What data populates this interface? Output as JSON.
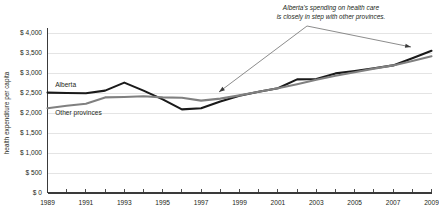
{
  "chart_data": {
    "type": "line",
    "title": "",
    "subtitle": "",
    "xlabel": "",
    "ylabel": "health expenditure per capita",
    "ylim": [
      0,
      4000
    ],
    "xlim": [
      1989,
      2009
    ],
    "grid": true,
    "legend_position": "inline-labels",
    "y_ticks": [
      0,
      500,
      1000,
      1500,
      2000,
      2500,
      3000,
      3500,
      4000
    ],
    "y_tick_labels": [
      "$ 0",
      "$ 500",
      "$ 1,000",
      "$ 1,500",
      "$ 2,000",
      "$ 2,500",
      "$ 3,000",
      "$ 3,500",
      "$ 4,000"
    ],
    "x": [
      1989,
      1990,
      1991,
      1992,
      1993,
      1994,
      1995,
      1996,
      1997,
      1998,
      1999,
      2000,
      2001,
      2002,
      2003,
      2004,
      2005,
      2006,
      2007,
      2008,
      2009
    ],
    "x_tick_labels": [
      "1989",
      "",
      "1991",
      "",
      "1993",
      "",
      "1995",
      "",
      "1997",
      "",
      "1999",
      "",
      "2001",
      "",
      "2003",
      "",
      "2005",
      "",
      "2007",
      "",
      "2009"
    ],
    "x_labeled_ticks": [
      "1989",
      "1991",
      "1993",
      "1995",
      "1997",
      "1999",
      "2001",
      "2003",
      "2005",
      "2007",
      "2009"
    ],
    "series": [
      {
        "name": "Alberta",
        "color": "#1a1a1a",
        "label_x": 1989.4,
        "label_y": 2640,
        "values": [
          2510,
          2500,
          2495,
          2560,
          2760,
          2560,
          2340,
          2090,
          2120,
          2290,
          2430,
          2530,
          2620,
          2840,
          2850,
          2990,
          3050,
          3120,
          3190,
          3370,
          3555
        ]
      },
      {
        "name": "Other provinces",
        "color": "#808080",
        "label_x": 1989.4,
        "label_y": 1960,
        "values": [
          2120,
          2180,
          2230,
          2390,
          2400,
          2420,
          2390,
          2380,
          2310,
          2360,
          2440,
          2530,
          2620,
          2720,
          2830,
          2930,
          3020,
          3110,
          3190,
          3300,
          3420
        ]
      }
    ],
    "annotations": [
      {
        "name": "callout",
        "line1": "Alberta's spending on health care",
        "line2": "is closely in step with other provinces.",
        "text_x": 331,
        "text_y1": 10,
        "text_y2": 19,
        "arrows": [
          {
            "name": "arrow-left",
            "x1": 307,
            "y1": 26,
            "x2": 219,
            "y2": 92
          },
          {
            "name": "arrow-right",
            "x1": 307,
            "y1": 26,
            "x2": 411,
            "y2": 47
          }
        ]
      }
    ]
  }
}
